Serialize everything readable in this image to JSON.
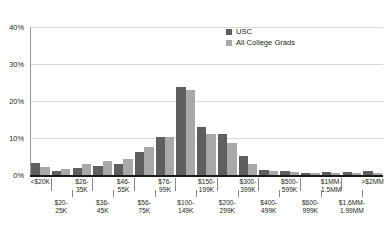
{
  "chart_data": {
    "type": "bar",
    "title": "",
    "xlabel": "",
    "ylabel": "",
    "ylim": [
      0,
      40
    ],
    "yticks": [
      "0%",
      "10%",
      "20%",
      "30%",
      "40%"
    ],
    "ytick_values": [
      0,
      10,
      20,
      30,
      40
    ],
    "grid": true,
    "legend_position": "top-center-right",
    "categories": [
      "<$20K",
      "$20-\n25K",
      "$26-\n35K",
      "$36-\n45K",
      "$46-\n55K",
      "$56-\n75K",
      "$76-\n99K",
      "$100-\n149K",
      "$150-\n199K",
      "$200-\n299K",
      "$300-\n399K",
      "$400-\n499K",
      "$500-\n599K",
      "$600-\n999K",
      "$1MM-\n1.5MM",
      "$1.6MM-\n1.99MM",
      ">$2MM"
    ],
    "series": [
      {
        "name": "USC",
        "color": "#5f5f5f",
        "values": [
          3.3,
          1.1,
          2.0,
          2.4,
          3.1,
          6.2,
          10.3,
          23.9,
          13.0,
          11.0,
          5.1,
          1.4,
          1.1,
          0.6,
          0.7,
          0.9,
          1.1
        ]
      },
      {
        "name": "All College Grads",
        "color": "#a8a8a8",
        "values": [
          2.1,
          1.5,
          2.9,
          3.7,
          4.4,
          7.5,
          10.3,
          23.0,
          11.2,
          8.7,
          2.9,
          1.1,
          0.8,
          0.5,
          0.5,
          0.6,
          0.6
        ]
      }
    ]
  },
  "legend": {
    "items": [
      {
        "label": "USC",
        "color": "#5f5f5f"
      },
      {
        "label": "All College Grads",
        "color": "#a8a8a8"
      }
    ]
  },
  "colors": {
    "series_usc": "#5f5f5f",
    "series_grads": "#a8a8a8",
    "gridline": "#d9d9d9",
    "axis": "#1a1a1a",
    "text": "#231f20",
    "background": "#ffffff"
  }
}
